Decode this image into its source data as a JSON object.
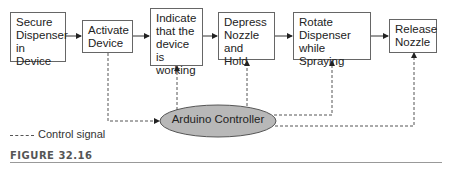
{
  "diagram": {
    "steps": [
      {
        "id": "secure",
        "label": "Secure Dispenser in Device"
      },
      {
        "id": "activate",
        "label": "Activate Device"
      },
      {
        "id": "indicate",
        "label": "Indicate that the device is working"
      },
      {
        "id": "depress",
        "label": "Depress Nozzle and Hold"
      },
      {
        "id": "rotate",
        "label": "Rotate Dispenser while Spraying"
      },
      {
        "id": "release",
        "label": "Release Nozzle"
      }
    ],
    "controller": {
      "label": "Arduino Controller",
      "fill": "#b8b8b8"
    },
    "legend": {
      "label": "Control signal"
    },
    "caption": "FIGURE 32.16"
  }
}
